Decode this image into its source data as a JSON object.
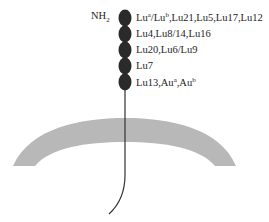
{
  "diagram": {
    "terminus_label": "NH",
    "terminus_subscript": "2",
    "domains": [
      {
        "label": "Lu",
        "sup1": "a",
        "mid": "/Lu",
        "sup2": "b",
        "rest": ",Lu21,Lu5,Lu17,Lu12"
      },
      {
        "label": "Lu4,Lu8/14,Lu16"
      },
      {
        "label": "Lu20,Lu6/Lu9"
      },
      {
        "label": "Lu7"
      },
      {
        "label": "Lu13,Au",
        "sup1": "a",
        "mid": ",Au",
        "sup2": "b"
      }
    ],
    "colors": {
      "bead": "#2a2a2a",
      "membrane": "#b8b8b8",
      "stalk": "#333333"
    }
  }
}
